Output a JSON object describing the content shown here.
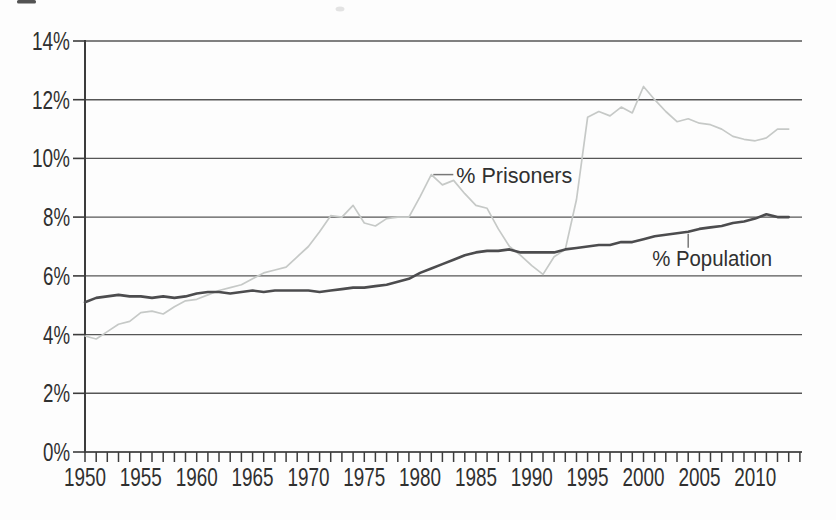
{
  "figure": {
    "description_labels": {
      "prisoners_series_label": "% Prisoners",
      "population_series_label": "% Population"
    }
  },
  "chart_data": {
    "type": "line",
    "title": "",
    "xlabel": "",
    "ylabel": "",
    "x_start": 1950,
    "x_end": 2013,
    "x_step": 1,
    "xlim": [
      1950,
      2014
    ],
    "ylim": [
      0,
      14
    ],
    "grid": "horizontal",
    "legend": "inline-annotations",
    "y_tick_labels": [
      "0%",
      "2%",
      "4%",
      "6%",
      "8%",
      "10%",
      "12%",
      "14%"
    ],
    "x_axis_labels": [
      "1950",
      "1955",
      "1960",
      "1965",
      "1970",
      "1975",
      "1980",
      "1985",
      "1990",
      "1995",
      "2000",
      "2005",
      "2010"
    ],
    "colors": {
      "background": "#fdfdfd",
      "gridline": "#565656",
      "axis": "#3c3c3c",
      "text": "#303030",
      "leader": "#787878",
      "prisoners_line": "#c6c9c7",
      "population_line": "#4c4c4e"
    },
    "series": [
      {
        "name": "% Prisoners",
        "color": "#c6c9c7",
        "stroke_width": 1.7,
        "values": [
          3.95,
          3.85,
          4.1,
          4.35,
          4.45,
          4.75,
          4.8,
          4.7,
          4.95,
          5.15,
          5.2,
          5.35,
          5.5,
          5.6,
          5.7,
          5.9,
          6.1,
          6.2,
          6.3,
          6.65,
          7.0,
          7.5,
          8.05,
          8.0,
          8.4,
          7.8,
          7.7,
          7.95,
          8.0,
          8.0,
          8.7,
          9.45,
          9.1,
          9.25,
          8.8,
          8.4,
          8.3,
          7.6,
          7.0,
          6.7,
          6.35,
          6.05,
          6.65,
          6.9,
          8.6,
          11.4,
          11.6,
          11.45,
          11.75,
          11.55,
          12.45,
          12.0,
          11.6,
          11.25,
          11.35,
          11.2,
          11.15,
          11.0,
          10.75,
          10.65,
          10.6,
          10.7,
          11.0,
          11.0
        ]
      },
      {
        "name": "% Population",
        "color": "#4c4c4e",
        "stroke_width": 2.6,
        "values": [
          5.1,
          5.25,
          5.3,
          5.35,
          5.3,
          5.3,
          5.25,
          5.3,
          5.25,
          5.3,
          5.4,
          5.45,
          5.45,
          5.4,
          5.45,
          5.5,
          5.45,
          5.5,
          5.5,
          5.5,
          5.5,
          5.45,
          5.5,
          5.55,
          5.6,
          5.6,
          5.65,
          5.7,
          5.8,
          5.9,
          6.1,
          6.25,
          6.4,
          6.55,
          6.7,
          6.8,
          6.85,
          6.85,
          6.9,
          6.8,
          6.8,
          6.8,
          6.8,
          6.9,
          6.95,
          7.0,
          7.05,
          7.05,
          7.15,
          7.15,
          7.25,
          7.35,
          7.4,
          7.45,
          7.5,
          7.6,
          7.65,
          7.7,
          7.8,
          7.85,
          7.95,
          8.1,
          8.0,
          8.0
        ]
      }
    ],
    "annotations": [
      {
        "text": "% Prisoners",
        "anchor_year": 1981,
        "anchor_value": 9.45,
        "leader": "horizontal-right"
      },
      {
        "text": "% Population",
        "anchor_year": 2004,
        "anchor_value": 7.5,
        "leader": "vertical-down"
      }
    ]
  }
}
